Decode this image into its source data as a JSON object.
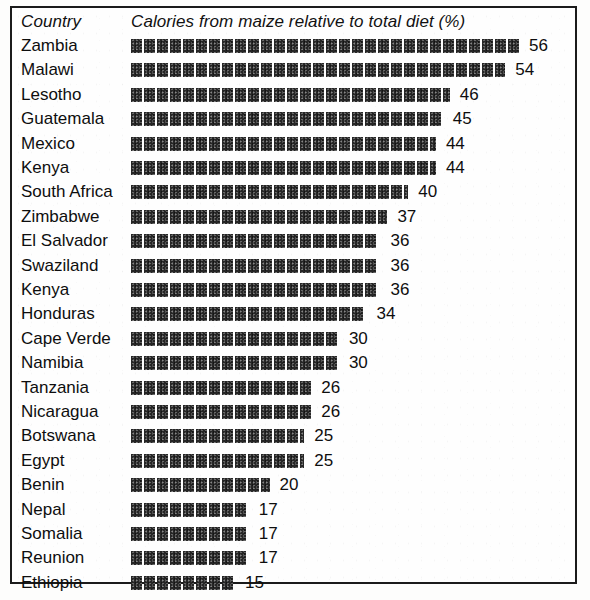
{
  "header": {
    "country_label": "Country",
    "measure_label": "Calories from maize relative to total diet (%)"
  },
  "chart_data": {
    "type": "bar",
    "orientation": "horizontal",
    "title": "Calories from maize relative to total diet (%)",
    "xlabel": "Calories from maize relative to total diet (%)",
    "ylabel": "Country",
    "xlim": [
      0,
      56
    ],
    "grid": false,
    "legend": null,
    "units": "%",
    "bar_style": "segmented-blocks",
    "value_labels_shown": true,
    "categories": [
      "Zambia",
      "Malawi",
      "Lesotho",
      "Guatemala",
      "Mexico",
      "Kenya",
      "South Africa",
      "Zimbabwe",
      "El Salvador",
      "Swaziland",
      "Kenya",
      "Honduras",
      "Cape Verde",
      "Namibia",
      "Tanzania",
      "Nicaragua",
      "Botswana",
      "Egypt",
      "Benin",
      "Nepal",
      "Somalia",
      "Reunion",
      "Ethiopia"
    ],
    "values": [
      56,
      54,
      46,
      45,
      44,
      44,
      40,
      37,
      36,
      36,
      36,
      34,
      30,
      30,
      26,
      26,
      25,
      25,
      20,
      17,
      17,
      17,
      15
    ]
  },
  "style": {
    "bar_color": "#262626",
    "text_color": "#0e0e0e",
    "frame_color": "#1b1b1b",
    "background": "#fefefe"
  }
}
